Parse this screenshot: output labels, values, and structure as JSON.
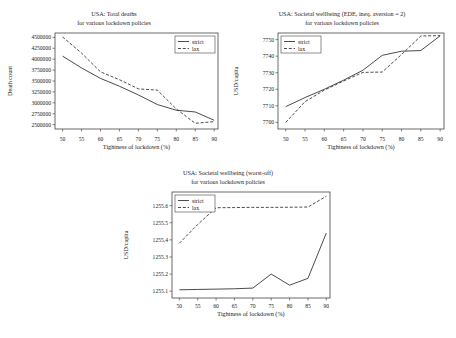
{
  "figure": {
    "shared": {
      "xlabel": "Tightness of lockdown (%)",
      "xticks": [
        50,
        55,
        60,
        65,
        70,
        75,
        80,
        85,
        90
      ],
      "legend": {
        "strict": "strict",
        "lax": "lax"
      }
    }
  },
  "chart_data": [
    {
      "id": "total-deaths",
      "type": "line",
      "title_line1": "USA: Total deaths",
      "title_line2": "for various lockdown policies",
      "xlabel": "Tightness of lockdown (%)",
      "ylabel": "Death count",
      "xlim": [
        48,
        91
      ],
      "ylim": [
        2400000,
        4600000
      ],
      "xticks": [
        50,
        55,
        60,
        65,
        70,
        75,
        80,
        85,
        90
      ],
      "yticks": [
        2500000,
        2750000,
        3000000,
        3250000,
        3500000,
        3750000,
        4000000,
        4250000,
        4500000
      ],
      "ytick_labels": [
        "2500000",
        "2750000",
        "3000000",
        "3250000",
        "3500000",
        "3750000",
        "4000000",
        "4250000",
        "4500000"
      ],
      "grid": false,
      "legend_position": "upper right",
      "x": [
        50,
        55,
        60,
        65,
        70,
        75,
        80,
        85,
        90
      ],
      "series": [
        {
          "name": "strict",
          "style": "solid",
          "values": [
            4070000,
            3800000,
            3560000,
            3380000,
            3180000,
            2960000,
            2830000,
            2790000,
            2600000
          ]
        },
        {
          "name": "lax",
          "style": "dashed",
          "values": [
            4510000,
            4140000,
            3710000,
            3530000,
            3320000,
            3290000,
            2860000,
            2530000,
            2570000
          ]
        }
      ]
    },
    {
      "id": "wellbeing-ede",
      "type": "line",
      "title_line1": "USA: Societal wellbeing (EDE, ineq. aversion = 2)",
      "title_line2": "for various lockdown policies",
      "xlabel": "Tightness of lockdown (%)",
      "ylabel": "USD/capita",
      "xlim": [
        48,
        91
      ],
      "ylim": [
        7696,
        7754
      ],
      "xticks": [
        50,
        55,
        60,
        65,
        70,
        75,
        80,
        85,
        90
      ],
      "yticks": [
        7700,
        7710,
        7720,
        7730,
        7740,
        7750
      ],
      "ytick_labels": [
        "7700",
        "7710",
        "7720",
        "7730",
        "7740",
        "7750"
      ],
      "grid": false,
      "legend_position": "upper left",
      "x": [
        50,
        55,
        60,
        65,
        70,
        75,
        80,
        85,
        90
      ],
      "series": [
        {
          "name": "strict",
          "style": "solid",
          "values": [
            7709.5,
            7715.0,
            7720.0,
            7725.5,
            7731.5,
            7740.5,
            7743.0,
            7743.4,
            7752.3
          ]
        },
        {
          "name": "lax",
          "style": "dashed",
          "values": [
            7700.0,
            7712.5,
            7719.5,
            7725.0,
            7730.2,
            7730.4,
            7741.0,
            7752.2,
            7752.4
          ]
        }
      ]
    },
    {
      "id": "wellbeing-worst-off",
      "type": "line",
      "title_line1": "USA: Societal wellbeing (worst-off)",
      "title_line2": "for various lockdown policies",
      "xlabel": "Tightness of lockdown (%)",
      "ylabel": "USD/capita",
      "xlim": [
        48,
        91
      ],
      "ylim": [
        1255.06,
        1255.68
      ],
      "xticks": [
        50,
        55,
        60,
        65,
        70,
        75,
        80,
        85,
        90
      ],
      "yticks": [
        1255.1,
        1255.2,
        1255.3,
        1255.4,
        1255.5,
        1255.6
      ],
      "ytick_labels": [
        "1255.1",
        "1255.2",
        "1255.3",
        "1255.4",
        "1255.5",
        "1255.6"
      ],
      "grid": false,
      "legend_position": "upper left",
      "x": [
        50,
        55,
        60,
        65,
        70,
        75,
        80,
        85,
        90
      ],
      "series": [
        {
          "name": "strict",
          "style": "solid",
          "values": [
            1255.108,
            1255.11,
            1255.112,
            1255.114,
            1255.118,
            1255.2,
            1255.135,
            1255.175,
            1255.44
          ]
        },
        {
          "name": "lax",
          "style": "dashed",
          "values": [
            1255.38,
            1255.49,
            1255.588,
            1255.589,
            1255.59,
            1255.59,
            1255.591,
            1255.592,
            1255.655
          ]
        }
      ]
    }
  ]
}
